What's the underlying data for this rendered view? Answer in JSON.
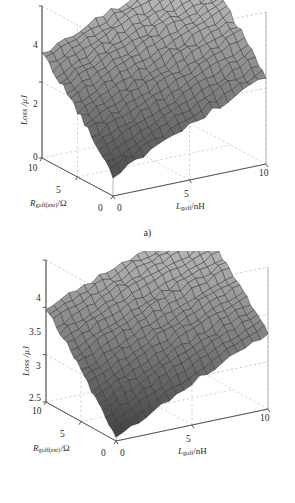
{
  "figure": {
    "background": "#ffffff",
    "panels": [
      {
        "id": "a",
        "caption": "a)",
        "z_axis": {
          "label_text": "Loss /",
          "label_unit": "μJ",
          "ticks": [
            "4",
            "2",
            "0"
          ],
          "min": 0,
          "max": 4
        },
        "x_axis": {
          "label_var": "R",
          "label_sub": "goff(ext)",
          "label_unit": "/Ω",
          "ticks": [
            "10",
            "5",
            "0"
          ],
          "min": 0,
          "max": 10
        },
        "y_axis": {
          "label_var": "L",
          "label_sub": "goff",
          "label_unit": "/nH",
          "ticks": [
            "0",
            "5",
            "10"
          ],
          "min": 0,
          "max": 10
        }
      },
      {
        "id": "b",
        "caption": "b)",
        "z_axis": {
          "label_text": "Loss /",
          "label_unit": "μJ",
          "ticks": [
            "4",
            "3.5",
            "3",
            "2.5"
          ],
          "min": 2.5,
          "max": 4
        },
        "x_axis": {
          "label_var": "R",
          "label_sub": "goff(ext)",
          "label_unit": "/Ω",
          "ticks": [
            "10",
            "5",
            "0"
          ],
          "min": 0,
          "max": 10
        },
        "y_axis": {
          "label_var": "L",
          "label_sub": "goff",
          "label_unit": "/nH",
          "ticks": [
            "0",
            "5",
            "10"
          ],
          "min": 0,
          "max": 10
        }
      }
    ]
  },
  "chart_data": [
    {
      "type": "heatmap",
      "render": "surface3d",
      "title": "",
      "panel": "a",
      "xlabel": "R_goff(ext) /Ω",
      "ylabel": "L_goff /nH",
      "zlabel": "Loss /μJ",
      "xlim": [
        0,
        10
      ],
      "ylim": [
        0,
        10
      ],
      "zlim": [
        0,
        4
      ],
      "grid": true,
      "legend": "none",
      "colormap": "gray",
      "x": [
        0,
        1,
        2,
        3,
        4,
        5,
        6,
        7,
        8,
        9,
        10
      ],
      "y": [
        0,
        1,
        2,
        3,
        4,
        5,
        6,
        7,
        8,
        9,
        10
      ],
      "z": [
        [
          0.55,
          0.72,
          0.9,
          1.08,
          1.25,
          1.42,
          1.6,
          1.78,
          1.95,
          2.12,
          2.3
        ],
        [
          0.78,
          0.96,
          1.14,
          1.32,
          1.5,
          1.66,
          1.85,
          2.02,
          2.2,
          2.36,
          2.55
        ],
        [
          1.02,
          1.2,
          1.38,
          1.56,
          1.74,
          1.92,
          2.1,
          2.26,
          2.44,
          2.62,
          2.8
        ],
        [
          1.26,
          1.44,
          1.62,
          1.8,
          1.98,
          2.16,
          2.33,
          2.5,
          2.68,
          2.86,
          3.02
        ],
        [
          1.5,
          1.68,
          1.86,
          2.04,
          2.22,
          2.4,
          2.57,
          2.74,
          2.92,
          3.08,
          3.24
        ],
        [
          1.74,
          1.92,
          2.1,
          2.28,
          2.46,
          2.62,
          2.8,
          2.97,
          3.14,
          3.3,
          3.45
        ],
        [
          1.96,
          2.14,
          2.32,
          2.5,
          2.68,
          2.85,
          3.02,
          3.18,
          3.34,
          3.5,
          3.64
        ],
        [
          2.18,
          2.36,
          2.54,
          2.72,
          2.89,
          3.06,
          3.22,
          3.38,
          3.53,
          3.68,
          3.8
        ],
        [
          2.38,
          2.56,
          2.74,
          2.92,
          3.09,
          3.25,
          3.41,
          3.56,
          3.7,
          3.84,
          3.94
        ],
        [
          2.56,
          2.74,
          2.92,
          3.1,
          3.26,
          3.42,
          3.57,
          3.71,
          3.84,
          3.96,
          4.06
        ],
        [
          2.72,
          2.9,
          3.08,
          3.26,
          3.42,
          3.57,
          3.71,
          3.84,
          3.96,
          4.07,
          4.16
        ]
      ]
    },
    {
      "type": "heatmap",
      "render": "surface3d",
      "title": "",
      "panel": "b",
      "xlabel": "R_goff(ext) /Ω",
      "ylabel": "L_goff /nH",
      "zlabel": "Loss /μJ",
      "xlim": [
        0,
        10
      ],
      "ylim": [
        0,
        10
      ],
      "zlim": [
        2.5,
        4
      ],
      "grid": true,
      "legend": "none",
      "colormap": "gray",
      "x": [
        0,
        1,
        2,
        3,
        4,
        5,
        6,
        7,
        8,
        9,
        10
      ],
      "y": [
        0,
        1,
        2,
        3,
        4,
        5,
        6,
        7,
        8,
        9,
        10
      ],
      "z": [
        [
          2.54,
          2.62,
          2.7,
          2.78,
          2.86,
          2.94,
          3.02,
          3.1,
          3.17,
          3.24,
          3.31
        ],
        [
          2.64,
          2.72,
          2.8,
          2.88,
          2.96,
          3.04,
          3.12,
          3.19,
          3.26,
          3.33,
          3.4
        ],
        [
          2.74,
          2.82,
          2.9,
          2.98,
          3.06,
          3.14,
          3.21,
          3.28,
          3.35,
          3.42,
          3.48
        ],
        [
          2.84,
          2.92,
          3.0,
          3.08,
          3.16,
          3.23,
          3.3,
          3.37,
          3.44,
          3.5,
          3.56
        ],
        [
          2.94,
          3.02,
          3.1,
          3.18,
          3.25,
          3.32,
          3.39,
          3.46,
          3.52,
          3.58,
          3.64
        ],
        [
          3.04,
          3.12,
          3.2,
          3.27,
          3.34,
          3.41,
          3.48,
          3.54,
          3.6,
          3.66,
          3.72
        ],
        [
          3.14,
          3.21,
          3.29,
          3.36,
          3.43,
          3.5,
          3.56,
          3.62,
          3.68,
          3.74,
          3.79
        ],
        [
          3.23,
          3.3,
          3.38,
          3.45,
          3.51,
          3.58,
          3.64,
          3.7,
          3.76,
          3.81,
          3.86
        ],
        [
          3.32,
          3.39,
          3.46,
          3.53,
          3.6,
          3.66,
          3.72,
          3.77,
          3.83,
          3.88,
          3.93
        ],
        [
          3.4,
          3.47,
          3.54,
          3.61,
          3.67,
          3.73,
          3.79,
          3.84,
          3.9,
          3.95,
          3.99
        ],
        [
          3.48,
          3.55,
          3.62,
          3.68,
          3.74,
          3.8,
          3.86,
          3.91,
          3.96,
          4.01,
          4.05
        ]
      ]
    }
  ]
}
